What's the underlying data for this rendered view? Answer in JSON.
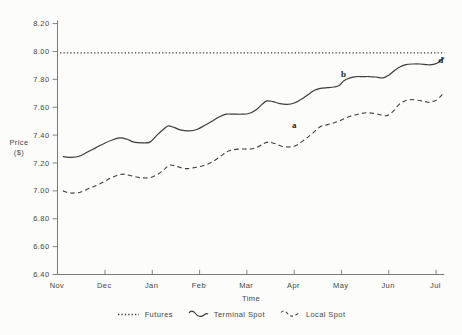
{
  "colors": {
    "line": "#3d3d3d",
    "axis": "#6a6a6a",
    "text": "#454545",
    "background": "#fcfcfb"
  },
  "legend": {
    "items": [
      {
        "label": "Futures",
        "style": "dotted"
      },
      {
        "label": "Terminal Spot",
        "style": "solid"
      },
      {
        "label": "Local Spot",
        "style": "dashed"
      }
    ]
  },
  "chart_data": {
    "type": "line",
    "title": "",
    "xlabel": "Time",
    "ylabel": "Price ($)",
    "ylabel_lines": [
      "Price",
      "($)"
    ],
    "x_tick_labels": [
      "Nov",
      "Dec",
      "Jan",
      "Feb",
      "Mar",
      "Apr",
      "May",
      "Jun",
      "Jul"
    ],
    "y_ticks": [
      6.4,
      6.6,
      6.8,
      7.0,
      7.2,
      7.4,
      7.6,
      7.8,
      8.0,
      8.2
    ],
    "y_tick_labels": [
      "6.40",
      "6.60",
      "6.80",
      "7.00",
      "7.20",
      "7.40",
      "7.60",
      "7.80",
      "8.00",
      "8.20"
    ],
    "xlim": [
      0,
      8
    ],
    "ylim": [
      6.4,
      8.2
    ],
    "grid": false,
    "legend_position": "bottom",
    "series": [
      {
        "name": "Futures",
        "style": "dotted",
        "points": [
          [
            0.05,
            7.99
          ],
          [
            8.18,
            7.99
          ]
        ]
      },
      {
        "name": "Terminal Spot",
        "style": "solid",
        "points": [
          [
            0.11,
            7.245
          ],
          [
            0.3,
            7.24
          ],
          [
            0.47,
            7.25
          ],
          [
            0.64,
            7.28
          ],
          [
            0.81,
            7.31
          ],
          [
            0.98,
            7.34
          ],
          [
            1.15,
            7.365
          ],
          [
            1.32,
            7.38
          ],
          [
            1.47,
            7.37
          ],
          [
            1.61,
            7.35
          ],
          [
            1.78,
            7.345
          ],
          [
            1.95,
            7.35
          ],
          [
            2.1,
            7.4
          ],
          [
            2.23,
            7.44
          ],
          [
            2.33,
            7.465
          ],
          [
            2.46,
            7.455
          ],
          [
            2.61,
            7.435
          ],
          [
            2.78,
            7.43
          ],
          [
            2.94,
            7.44
          ],
          [
            3.11,
            7.47
          ],
          [
            3.26,
            7.5
          ],
          [
            3.41,
            7.53
          ],
          [
            3.56,
            7.55
          ],
          [
            3.73,
            7.55
          ],
          [
            3.9,
            7.55
          ],
          [
            4.04,
            7.555
          ],
          [
            4.19,
            7.58
          ],
          [
            4.32,
            7.62
          ],
          [
            4.42,
            7.645
          ],
          [
            4.55,
            7.64
          ],
          [
            4.7,
            7.625
          ],
          [
            4.85,
            7.62
          ],
          [
            5.0,
            7.63
          ],
          [
            5.14,
            7.655
          ],
          [
            5.29,
            7.69
          ],
          [
            5.42,
            7.72
          ],
          [
            5.55,
            7.735
          ],
          [
            5.71,
            7.74
          ],
          [
            5.84,
            7.745
          ],
          [
            5.95,
            7.755
          ],
          [
            6.05,
            7.79
          ],
          [
            6.18,
            7.81
          ],
          [
            6.31,
            7.82
          ],
          [
            6.45,
            7.82
          ],
          [
            6.6,
            7.82
          ],
          [
            6.75,
            7.815
          ],
          [
            6.88,
            7.81
          ],
          [
            7.0,
            7.83
          ],
          [
            7.11,
            7.86
          ],
          [
            7.24,
            7.89
          ],
          [
            7.36,
            7.905
          ],
          [
            7.51,
            7.91
          ],
          [
            7.66,
            7.91
          ],
          [
            7.81,
            7.905
          ],
          [
            7.91,
            7.905
          ],
          [
            8.02,
            7.915
          ],
          [
            8.1,
            7.935
          ],
          [
            8.17,
            7.955
          ]
        ]
      },
      {
        "name": "Local Spot",
        "style": "dashed",
        "points": [
          [
            0.11,
            7.0
          ],
          [
            0.26,
            6.985
          ],
          [
            0.47,
            6.99
          ],
          [
            0.68,
            7.02
          ],
          [
            0.89,
            7.05
          ],
          [
            1.11,
            7.09
          ],
          [
            1.25,
            7.11
          ],
          [
            1.38,
            7.12
          ],
          [
            1.53,
            7.11
          ],
          [
            1.74,
            7.095
          ],
          [
            1.95,
            7.095
          ],
          [
            2.12,
            7.12
          ],
          [
            2.27,
            7.16
          ],
          [
            2.37,
            7.185
          ],
          [
            2.52,
            7.175
          ],
          [
            2.69,
            7.16
          ],
          [
            2.86,
            7.165
          ],
          [
            3.07,
            7.18
          ],
          [
            3.28,
            7.21
          ],
          [
            3.49,
            7.26
          ],
          [
            3.64,
            7.29
          ],
          [
            3.85,
            7.3
          ],
          [
            4.07,
            7.3
          ],
          [
            4.23,
            7.315
          ],
          [
            4.36,
            7.34
          ],
          [
            4.45,
            7.35
          ],
          [
            4.59,
            7.34
          ],
          [
            4.74,
            7.32
          ],
          [
            4.91,
            7.315
          ],
          [
            5.06,
            7.33
          ],
          [
            5.23,
            7.37
          ],
          [
            5.38,
            7.41
          ],
          [
            5.55,
            7.46
          ],
          [
            5.71,
            7.475
          ],
          [
            5.86,
            7.49
          ],
          [
            6.01,
            7.51
          ],
          [
            6.18,
            7.535
          ],
          [
            6.35,
            7.55
          ],
          [
            6.52,
            7.56
          ],
          [
            6.69,
            7.555
          ],
          [
            6.84,
            7.545
          ],
          [
            6.96,
            7.54
          ],
          [
            7.09,
            7.57
          ],
          [
            7.22,
            7.62
          ],
          [
            7.34,
            7.645
          ],
          [
            7.47,
            7.655
          ],
          [
            7.62,
            7.65
          ],
          [
            7.77,
            7.64
          ],
          [
            7.87,
            7.635
          ],
          [
            8.0,
            7.65
          ],
          [
            8.1,
            7.68
          ],
          [
            8.17,
            7.71
          ]
        ]
      }
    ],
    "annotations": [
      {
        "label": "a",
        "x": 5.0,
        "y": 7.47
      },
      {
        "label": "b",
        "x": 6.04,
        "y": 7.84
      },
      {
        "label": "d",
        "x": 8.1,
        "y": 7.94
      }
    ]
  }
}
